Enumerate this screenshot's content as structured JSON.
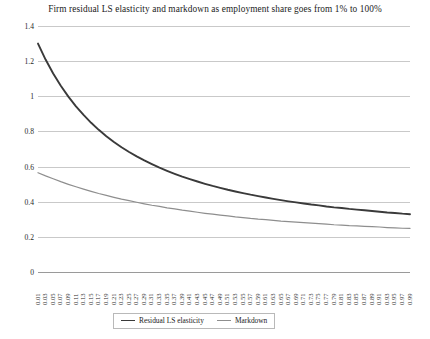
{
  "chart_data": {
    "type": "line",
    "title": "Firm residual LS elasticity and markdown as employment share goes from 1% to 100%",
    "xlabel": "",
    "ylabel": "",
    "ylim": [
      0,
      1.4
    ],
    "ytick_step": 0.2,
    "yticks": [
      "0",
      "0.2",
      "0.4",
      "0.6",
      "0.8",
      "1",
      "1.2",
      "1.4"
    ],
    "grid": true,
    "legend_position": "bottom",
    "x": [
      0.01,
      0.03,
      0.05,
      0.07,
      0.09,
      0.11,
      0.13,
      0.15,
      0.17,
      0.19,
      0.21,
      0.23,
      0.25,
      0.27,
      0.29,
      0.31,
      0.33,
      0.35,
      0.37,
      0.39,
      0.41,
      0.43,
      0.45,
      0.47,
      0.49,
      0.51,
      0.53,
      0.55,
      0.57,
      0.59,
      0.61,
      0.63,
      0.65,
      0.67,
      0.69,
      0.71,
      0.73,
      0.75,
      0.77,
      0.79,
      0.81,
      0.83,
      0.85,
      0.87,
      0.89,
      0.91,
      0.93,
      0.95,
      0.97,
      0.99
    ],
    "xtick_labels": [
      "0.01",
      "0.03",
      "0.05",
      "0.07",
      "0.09",
      "0.11",
      "0.13",
      "0.15",
      "0.17",
      "0.19",
      "0.21",
      "0.23",
      "0.25",
      "0.27",
      "0.29",
      "0.31",
      "0.33",
      "0.35",
      "0.37",
      "0.39",
      "0.41",
      "0.43",
      "0.45",
      "0.47",
      "0.49",
      "0.51",
      "0.53",
      "0.55",
      "0.57",
      "0.59",
      "0.61",
      "0.63",
      "0.65",
      "0.67",
      "0.69",
      "0.71",
      "0.73",
      "0.75",
      "0.77",
      "0.79",
      "0.81",
      "0.83",
      "0.85",
      "0.87",
      "0.89",
      "0.91",
      "0.93",
      "0.95",
      "0.97",
      "0.99"
    ],
    "series": [
      {
        "name": "Residual LS elasticity",
        "color": "#3a3a3a",
        "width": 1.9,
        "values": [
          1.3,
          1.209,
          1.13,
          1.06,
          0.998,
          0.943,
          0.894,
          0.849,
          0.809,
          0.773,
          0.74,
          0.71,
          0.683,
          0.658,
          0.635,
          0.614,
          0.594,
          0.576,
          0.559,
          0.543,
          0.529,
          0.515,
          0.502,
          0.49,
          0.479,
          0.468,
          0.458,
          0.449,
          0.44,
          0.432,
          0.424,
          0.416,
          0.409,
          0.402,
          0.396,
          0.39,
          0.384,
          0.379,
          0.373,
          0.368,
          0.364,
          0.359,
          0.355,
          0.351,
          0.347,
          0.343,
          0.339,
          0.336,
          0.332,
          0.329
        ]
      },
      {
        "name": "Markdown",
        "color": "#8e8e8e",
        "width": 1.2,
        "values": [
          0.565,
          0.547,
          0.531,
          0.514,
          0.499,
          0.485,
          0.472,
          0.459,
          0.447,
          0.436,
          0.425,
          0.415,
          0.406,
          0.397,
          0.388,
          0.38,
          0.373,
          0.365,
          0.359,
          0.352,
          0.346,
          0.34,
          0.334,
          0.329,
          0.324,
          0.319,
          0.314,
          0.31,
          0.305,
          0.301,
          0.298,
          0.294,
          0.29,
          0.287,
          0.284,
          0.281,
          0.278,
          0.275,
          0.272,
          0.269,
          0.267,
          0.264,
          0.262,
          0.26,
          0.258,
          0.256,
          0.253,
          0.251,
          0.249,
          0.248
        ]
      }
    ]
  },
  "legend": {
    "items": [
      {
        "label": "Residual LS elasticity"
      },
      {
        "label": "Markdown"
      }
    ]
  },
  "colors": {
    "gridline": "#c9c9c9",
    "axis": "#9a9a9a",
    "text": "#1b1b1b",
    "background": "#ffffff"
  }
}
